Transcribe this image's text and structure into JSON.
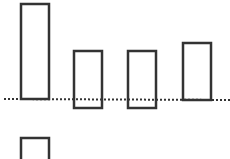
{
  "diagram": {
    "stroke_color": "#333333",
    "background": "#ffffff",
    "baseline": {
      "x1": 4,
      "y1": 99,
      "x2": 230,
      "y2": 100,
      "style": "dotted"
    },
    "bars": [
      {
        "id": "bar-1",
        "x": 21,
        "y": 4,
        "width": 28,
        "height": 95
      },
      {
        "id": "bar-2",
        "x": 74,
        "y": 51,
        "width": 28,
        "height": 57
      },
      {
        "id": "bar-3",
        "x": 128,
        "y": 51,
        "width": 28,
        "height": 57
      },
      {
        "id": "bar-4",
        "x": 183,
        "y": 43,
        "width": 28,
        "height": 57
      },
      {
        "id": "bar-5-partial",
        "x": 21,
        "y": 138,
        "width": 28,
        "height": 30
      }
    ]
  }
}
